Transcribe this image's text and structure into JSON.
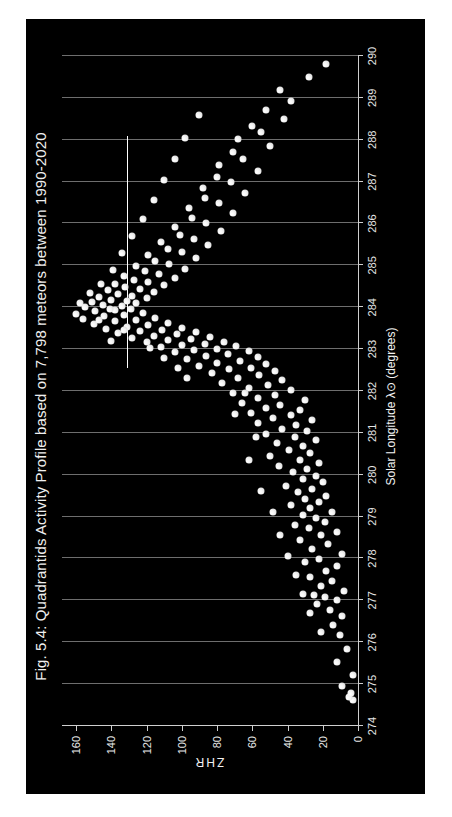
{
  "figure": {
    "title": "Fig. 5.4: Quadrantids Activity Profile based on 7,798 meteors between 1990-2020",
    "panel_background": "#000000",
    "point_color": "#f5f5f5",
    "gridline_color": "#6e6e6e",
    "axis_color": "#cfcfcf",
    "orientation": "rotated-90-ccw"
  },
  "chart_data": {
    "type": "scatter",
    "title": "Fig. 5.4: Quadrantids Activity Profile based on 7,798 meteors between 1990-2020",
    "xlabel": "Solar Longitude λ⊙ (degrees)",
    "ylabel": "ZHR",
    "xlim": [
      274,
      290
    ],
    "ylim": [
      0,
      168
    ],
    "xticks": [
      274,
      275,
      276,
      277,
      278,
      279,
      280,
      281,
      282,
      283,
      284,
      285,
      286,
      287,
      288,
      289,
      290
    ],
    "yticks": [
      0,
      20,
      40,
      60,
      80,
      100,
      120,
      140,
      160
    ],
    "grid": "vertical-only",
    "legend": "none",
    "n_meteors": "7,798",
    "annotations": [
      {
        "kind": "horizontal-reference-line",
        "y": 131,
        "x_start": 282.55,
        "x_end": 288.1,
        "color": "#ffffff"
      }
    ],
    "points": [
      [
        274.62,
        3
      ],
      [
        274.7,
        5
      ],
      [
        274.78,
        4
      ],
      [
        274.95,
        9
      ],
      [
        275.22,
        3
      ],
      [
        275.52,
        12
      ],
      [
        275.85,
        6
      ],
      [
        276.18,
        10
      ],
      [
        276.42,
        14
      ],
      [
        276.62,
        9
      ],
      [
        276.78,
        16
      ],
      [
        276.92,
        23
      ],
      [
        277.02,
        12
      ],
      [
        277.08,
        19
      ],
      [
        277.12,
        25
      ],
      [
        277.22,
        8
      ],
      [
        277.35,
        21
      ],
      [
        277.46,
        15
      ],
      [
        277.55,
        27
      ],
      [
        277.7,
        18
      ],
      [
        277.82,
        12
      ],
      [
        277.92,
        30
      ],
      [
        277.98,
        22
      ],
      [
        278.1,
        9
      ],
      [
        278.22,
        26
      ],
      [
        278.34,
        17
      ],
      [
        278.45,
        33
      ],
      [
        278.56,
        21
      ],
      [
        278.64,
        12
      ],
      [
        278.72,
        28
      ],
      [
        278.8,
        36
      ],
      [
        278.88,
        19
      ],
      [
        278.96,
        24
      ],
      [
        279.04,
        31
      ],
      [
        279.12,
        15
      ],
      [
        279.2,
        27
      ],
      [
        279.28,
        38
      ],
      [
        279.34,
        22
      ],
      [
        279.42,
        30
      ],
      [
        279.5,
        18
      ],
      [
        279.58,
        34
      ],
      [
        279.66,
        26
      ],
      [
        279.74,
        41
      ],
      [
        279.82,
        20
      ],
      [
        279.9,
        31
      ],
      [
        279.98,
        24
      ],
      [
        280.06,
        37
      ],
      [
        280.14,
        29
      ],
      [
        280.22,
        45
      ],
      [
        280.28,
        22
      ],
      [
        280.36,
        33
      ],
      [
        280.44,
        50
      ],
      [
        280.52,
        27
      ],
      [
        280.6,
        39
      ],
      [
        280.68,
        31
      ],
      [
        280.76,
        46
      ],
      [
        280.82,
        24
      ],
      [
        280.9,
        36
      ],
      [
        280.98,
        52
      ],
      [
        281.04,
        29
      ],
      [
        281.1,
        43
      ],
      [
        281.18,
        35
      ],
      [
        281.24,
        57
      ],
      [
        281.3,
        26
      ],
      [
        281.36,
        48
      ],
      [
        281.42,
        38
      ],
      [
        281.48,
        61
      ],
      [
        281.54,
        33
      ],
      [
        281.6,
        52
      ],
      [
        281.66,
        44
      ],
      [
        281.72,
        66
      ],
      [
        281.78,
        30
      ],
      [
        281.84,
        57
      ],
      [
        281.9,
        47
      ],
      [
        281.96,
        71
      ],
      [
        282.02,
        38
      ],
      [
        282.08,
        62
      ],
      [
        282.14,
        51
      ],
      [
        282.2,
        77
      ],
      [
        282.26,
        43
      ],
      [
        282.32,
        68
      ],
      [
        282.38,
        56
      ],
      [
        282.44,
        83
      ],
      [
        282.48,
        47
      ],
      [
        282.52,
        73
      ],
      [
        282.56,
        61
      ],
      [
        282.6,
        90
      ],
      [
        282.64,
        52
      ],
      [
        282.68,
        80
      ],
      [
        282.72,
        67
      ],
      [
        282.76,
        97
      ],
      [
        282.8,
        57
      ],
      [
        282.84,
        86
      ],
      [
        282.88,
        74
      ],
      [
        282.92,
        104
      ],
      [
        282.95,
        62
      ],
      [
        282.98,
        93
      ],
      [
        283.01,
        80
      ],
      [
        283.04,
        112
      ],
      [
        283.07,
        69
      ],
      [
        283.1,
        100
      ],
      [
        283.13,
        87
      ],
      [
        283.16,
        120
      ],
      [
        283.18,
        76
      ],
      [
        283.21,
        108
      ],
      [
        283.24,
        95
      ],
      [
        283.27,
        128
      ],
      [
        283.3,
        84
      ],
      [
        283.32,
        116
      ],
      [
        283.35,
        103
      ],
      [
        283.38,
        136
      ],
      [
        283.4,
        92
      ],
      [
        283.43,
        124
      ],
      [
        283.46,
        111
      ],
      [
        283.48,
        143
      ],
      [
        283.51,
        100
      ],
      [
        283.54,
        131
      ],
      [
        283.57,
        119
      ],
      [
        283.6,
        150
      ],
      [
        283.63,
        108
      ],
      [
        283.66,
        138
      ],
      [
        283.69,
        126
      ],
      [
        283.72,
        156
      ],
      [
        283.75,
        115
      ],
      [
        283.78,
        144
      ],
      [
        283.81,
        133
      ],
      [
        283.84,
        160
      ],
      [
        283.87,
        122
      ],
      [
        283.9,
        149
      ],
      [
        283.93,
        138
      ],
      [
        283.96,
        129
      ],
      [
        284.0,
        155
      ],
      [
        284.03,
        134
      ],
      [
        284.06,
        145
      ],
      [
        284.09,
        126
      ],
      [
        284.12,
        151
      ],
      [
        284.15,
        131
      ],
      [
        284.18,
        140
      ],
      [
        284.22,
        120
      ],
      [
        284.25,
        147
      ],
      [
        284.28,
        128
      ],
      [
        284.32,
        136
      ],
      [
        284.36,
        116
      ],
      [
        284.4,
        142
      ],
      [
        284.44,
        124
      ],
      [
        284.48,
        132
      ],
      [
        284.52,
        110
      ],
      [
        284.56,
        138
      ],
      [
        284.6,
        119
      ],
      [
        284.65,
        127
      ],
      [
        284.7,
        104
      ],
      [
        284.75,
        133
      ],
      [
        284.8,
        113
      ],
      [
        284.86,
        121
      ],
      [
        284.92,
        98
      ],
      [
        284.98,
        126
      ],
      [
        285.04,
        107
      ],
      [
        285.1,
        115
      ],
      [
        285.18,
        92
      ],
      [
        285.25,
        119
      ],
      [
        285.32,
        100
      ],
      [
        285.4,
        108
      ],
      [
        285.48,
        85
      ],
      [
        285.56,
        112
      ],
      [
        285.64,
        93
      ],
      [
        285.72,
        101
      ],
      [
        285.82,
        78
      ],
      [
        285.92,
        104
      ],
      [
        286.02,
        86
      ],
      [
        286.12,
        94
      ],
      [
        286.24,
        71
      ],
      [
        286.36,
        96
      ],
      [
        286.48,
        79
      ],
      [
        286.6,
        87
      ],
      [
        286.72,
        64
      ],
      [
        286.85,
        88
      ],
      [
        286.98,
        72
      ],
      [
        287.12,
        80
      ],
      [
        287.26,
        57
      ],
      [
        287.4,
        79
      ],
      [
        287.55,
        65
      ],
      [
        287.7,
        71
      ],
      [
        287.86,
        50
      ],
      [
        288.02,
        68
      ],
      [
        288.18,
        55
      ],
      [
        288.34,
        60
      ],
      [
        288.5,
        42
      ],
      [
        288.7,
        52
      ],
      [
        288.92,
        38
      ],
      [
        289.18,
        44
      ],
      [
        289.5,
        28
      ],
      [
        289.82,
        18
      ],
      [
        280.35,
        62
      ],
      [
        280.9,
        58
      ],
      [
        281.45,
        70
      ],
      [
        281.95,
        64
      ],
      [
        282.3,
        97
      ],
      [
        282.55,
        102
      ],
      [
        282.78,
        110
      ],
      [
        283.02,
        118
      ],
      [
        279.6,
        55
      ],
      [
        279.1,
        48
      ],
      [
        278.55,
        44
      ],
      [
        278.05,
        40
      ],
      [
        277.6,
        35
      ],
      [
        277.15,
        31
      ],
      [
        276.7,
        27
      ],
      [
        276.25,
        21
      ],
      [
        284.1,
        158
      ],
      [
        284.35,
        152
      ],
      [
        284.55,
        146
      ],
      [
        284.9,
        139
      ],
      [
        285.3,
        134
      ],
      [
        285.7,
        128
      ],
      [
        286.1,
        122
      ],
      [
        286.55,
        116
      ],
      [
        287.05,
        110
      ],
      [
        287.55,
        104
      ],
      [
        288.05,
        98
      ],
      [
        288.6,
        90
      ],
      [
        283.2,
        140
      ],
      [
        283.45,
        133
      ],
      [
        283.7,
        147
      ],
      [
        283.95,
        141
      ]
    ]
  },
  "axes": {
    "x_label": "Solar Longitude λ⊙ (degrees)",
    "y_label": "ZHR",
    "x_tick_labels": [
      "274",
      "275",
      "276",
      "277",
      "278",
      "279",
      "280",
      "281",
      "282",
      "283",
      "284",
      "285",
      "286",
      "287",
      "288",
      "289",
      "290"
    ],
    "y_tick_labels": [
      "0",
      "20",
      "40",
      "60",
      "80",
      "100",
      "120",
      "140",
      "160"
    ]
  }
}
